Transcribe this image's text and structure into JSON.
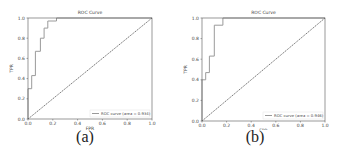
{
  "chart_data": [
    {
      "type": "line",
      "panel_label": "(a)",
      "title": "ROC Curve",
      "xlabel": "FPR",
      "ylabel": "TPR",
      "xlim": [
        0.0,
        1.0
      ],
      "ylim": [
        0.0,
        1.0
      ],
      "xticks": [
        "0.0",
        "0.2",
        "0.4",
        "0.6",
        "0.8",
        "1.0"
      ],
      "yticks": [
        "0.0",
        "0.2",
        "0.4",
        "0.6",
        "0.8",
        "1.0"
      ],
      "grid": false,
      "legend_position": "lower right",
      "series": [
        {
          "name": "ROC curve (area = 0.934)",
          "style": "step",
          "color": "#9a9a9a",
          "x": [
            0.0,
            0.0,
            0.03,
            0.03,
            0.06,
            0.06,
            0.1,
            0.1,
            0.13,
            0.13,
            0.16,
            0.16,
            0.23,
            0.23,
            1.0
          ],
          "y": [
            0.0,
            0.3,
            0.3,
            0.43,
            0.43,
            0.67,
            0.67,
            0.8,
            0.8,
            0.9,
            0.9,
            0.97,
            0.97,
            1.0,
            1.0
          ]
        },
        {
          "name": "chance",
          "style": "dashed",
          "color": "#6a6a6a",
          "x": [
            0.0,
            1.0
          ],
          "y": [
            0.0,
            1.0
          ]
        }
      ]
    },
    {
      "type": "line",
      "panel_label": "(b)",
      "title": "ROC Curve",
      "xlabel": "FPR",
      "ylabel": "TPR",
      "xlim": [
        0.0,
        1.0
      ],
      "ylim": [
        0.0,
        1.0
      ],
      "xticks": [
        "0.0",
        "0.2",
        "0.4",
        "0.6",
        "0.8",
        "1.0"
      ],
      "yticks": [
        "0.0",
        "0.2",
        "0.4",
        "0.6",
        "0.8",
        "1.0"
      ],
      "grid": false,
      "legend_position": "lower right",
      "series": [
        {
          "name": "ROC curve (area = 0.946)",
          "style": "step",
          "color": "#9a9a9a",
          "x": [
            0.0,
            0.0,
            0.03,
            0.03,
            0.06,
            0.06,
            0.1,
            0.1,
            0.17,
            0.17,
            1.0
          ],
          "y": [
            0.0,
            0.4,
            0.4,
            0.47,
            0.47,
            0.63,
            0.63,
            0.93,
            0.93,
            1.0,
            1.0
          ]
        },
        {
          "name": "chance",
          "style": "dashed",
          "color": "#6a6a6a",
          "x": [
            0.0,
            1.0
          ],
          "y": [
            0.0,
            1.0
          ]
        }
      ]
    }
  ]
}
